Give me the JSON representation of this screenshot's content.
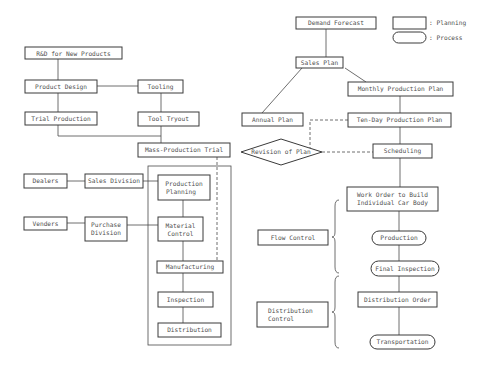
{
  "legend": {
    "planning_label": ": Planning",
    "process_label": ": Process"
  },
  "left": {
    "rd": "R&D for New Products",
    "product_design": "Product Design",
    "tooling": "Tooling",
    "trial_production": "Trial Production",
    "tool_tryout": "Tool Tryout",
    "mass_production_trial": "Mass-Production Trial",
    "dealers": "Dealers",
    "sales_division": "Sales Division",
    "production_planning": [
      "Production",
      "Planning"
    ],
    "venders": "Venders",
    "purchase_division": [
      "Purchase",
      "Division"
    ],
    "material_control": [
      "Material",
      "Control"
    ],
    "manufacturing": "Manufacturing",
    "inspection": "Inspection",
    "distribution": "Distribution"
  },
  "right": {
    "demand_forecast": "Demand Forecast",
    "sales_plan": "Sales Plan",
    "monthly_production_plan": "Monthly Production Plan",
    "annual_plan": "Annual Plan",
    "ten_day_production_plan": "Ten-Day Production Plan",
    "revision_of_plan": "Revision of Plan",
    "scheduling": "Scheduling",
    "work_order": [
      "Work Order to Build",
      "Individual Car Body"
    ],
    "flow_control": "Flow Control",
    "production": "Production",
    "final_inspection": "Final Inspection",
    "distribution_order": "Distribution Order",
    "distribution_control": [
      "Distribution",
      "Control"
    ],
    "transportation": "Transportation"
  }
}
